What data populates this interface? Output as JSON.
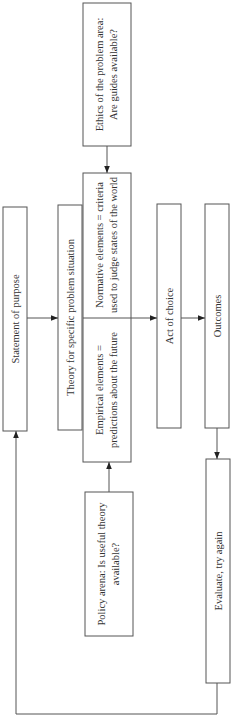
{
  "diagram": {
    "orientation": "rotated-90-ccw",
    "colors": {
      "stroke": "#555555",
      "text": "#333333",
      "background": "#ffffff"
    },
    "nodes": {
      "ethics": {
        "line1": "Ethics of the problem area:",
        "line2": "Are guides available?"
      },
      "statement": {
        "label": "Statement of purpose"
      },
      "theory": {
        "label": "Theory for specific problem situation"
      },
      "normative": {
        "line1": "Normative elements = criteria",
        "line2": "used to judge states of the world"
      },
      "empirical": {
        "line1": "Empirical elements =",
        "line2": "predictions about the future"
      },
      "policy": {
        "line1": "Policy arena: Is useful theory",
        "line2": "available?"
      },
      "act": {
        "label": "Act of choice"
      },
      "outcomes": {
        "label": "Outcomes"
      },
      "evaluate": {
        "label": "Evaluate, try again"
      }
    },
    "edges": [
      {
        "from": "ethics",
        "to": "normative"
      },
      {
        "from": "statement",
        "to": "theory"
      },
      {
        "from": "theory-elements",
        "to": "act"
      },
      {
        "from": "act",
        "to": "outcomes"
      },
      {
        "from": "policy",
        "to": "empirical"
      },
      {
        "from": "outcomes",
        "to": "evaluate"
      },
      {
        "from": "evaluate",
        "to": "statement",
        "type": "feedback-loop"
      }
    ]
  }
}
